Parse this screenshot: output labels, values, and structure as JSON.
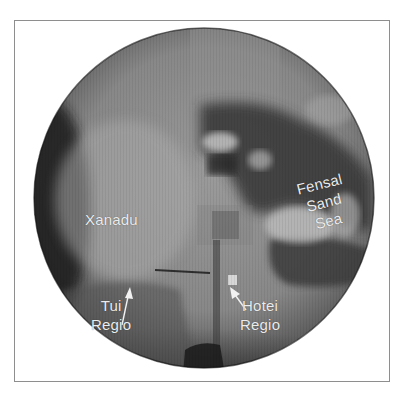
{
  "figure": {
    "labels": {
      "xanadu": "Xanadu",
      "fensal": [
        "Fensal",
        "Sand",
        "Sea"
      ],
      "tui": [
        "Tui",
        "Regio"
      ],
      "hotei": [
        "Hotei",
        "Regio"
      ]
    },
    "colors": {
      "frame_border": "#8e8e8e",
      "label_text": "#ececec",
      "globe_mid": "#8a8a8a",
      "globe_dark": "#1e1e1e"
    }
  }
}
